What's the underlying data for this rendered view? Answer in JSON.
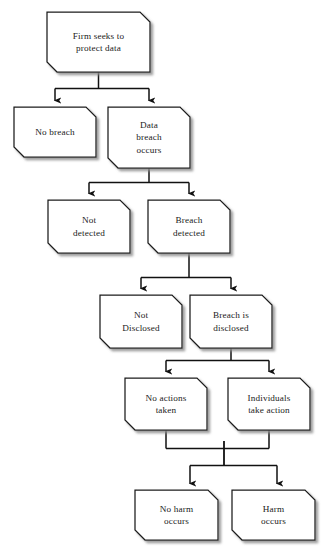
{
  "diagram": {
    "background_color": "#ffffff",
    "node_fill_color": "#ffffff",
    "node_stroke_color": "#1b1b1b",
    "connector_color": "#1b1b1b",
    "text_color": "#1b1b1b",
    "shadow_color": "#9a9a9a",
    "chamfer_px": 10,
    "nodes": [
      {
        "id": "firm-seeks-to-protect-data",
        "label": "Firm seeks to\nprotect data",
        "x": 47,
        "y": 12,
        "w": 103,
        "h": 60
      },
      {
        "id": "no-breach",
        "label": "No breach",
        "x": 14,
        "y": 107,
        "w": 82,
        "h": 50
      },
      {
        "id": "data-breach-occurs",
        "label": "Data\nbreach\noccurs",
        "x": 108,
        "y": 107,
        "w": 82,
        "h": 61
      },
      {
        "id": "not-detected",
        "label": "Not\ndetected",
        "x": 48,
        "y": 200,
        "w": 82,
        "h": 53
      },
      {
        "id": "breach-detected",
        "label": "Breach\ndetected",
        "x": 148,
        "y": 200,
        "w": 82,
        "h": 53
      },
      {
        "id": "not-disclosed",
        "label": "Not\nDisclosed",
        "x": 100,
        "y": 295,
        "w": 82,
        "h": 53
      },
      {
        "id": "breach-is-disclosed",
        "label": "Breach is\ndisclosed",
        "x": 190,
        "y": 295,
        "w": 82,
        "h": 53
      },
      {
        "id": "no-actions-taken",
        "label": "No actions\ntaken",
        "x": 125,
        "y": 378,
        "w": 82,
        "h": 52
      },
      {
        "id": "individuals-take-action",
        "label": "Individuals\ntake action",
        "x": 228,
        "y": 378,
        "w": 82,
        "h": 52
      },
      {
        "id": "no-harm-occurs",
        "label": "No harm\noccurs",
        "x": 135,
        "y": 490,
        "w": 83,
        "h": 50
      },
      {
        "id": "harm-occurs",
        "label": "Harm\noccurs",
        "x": 232,
        "y": 490,
        "w": 83,
        "h": 50
      }
    ],
    "edges": [
      {
        "id": "edge-protect-to-no-breach",
        "from": "firm-seeks-to-protect-data",
        "to": "no-breach"
      },
      {
        "id": "edge-protect-to-breach-occurs",
        "from": "firm-seeks-to-protect-data",
        "to": "data-breach-occurs"
      },
      {
        "id": "edge-breach-to-not-detected",
        "from": "data-breach-occurs",
        "to": "not-detected"
      },
      {
        "id": "edge-breach-to-detected",
        "from": "data-breach-occurs",
        "to": "breach-detected"
      },
      {
        "id": "edge-detected-to-not-disclosed",
        "from": "breach-detected",
        "to": "not-disclosed"
      },
      {
        "id": "edge-detected-to-disclosed",
        "from": "breach-detected",
        "to": "breach-is-disclosed"
      },
      {
        "id": "edge-disclosed-to-no-actions",
        "from": "breach-is-disclosed",
        "to": "no-actions-taken"
      },
      {
        "id": "edge-disclosed-to-individuals",
        "from": "breach-is-disclosed",
        "to": "individuals-take-action"
      },
      {
        "id": "edge-merge-to-no-harm",
        "from": "no-actions-taken",
        "to": "no-harm-occurs"
      },
      {
        "id": "edge-merge-to-harm",
        "from": "individuals-take-action",
        "to": "harm-occurs"
      }
    ]
  }
}
